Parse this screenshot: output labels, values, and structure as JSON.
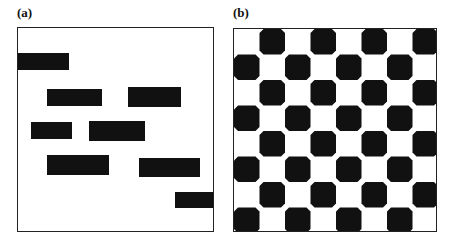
{
  "panels": [
    {
      "label": "(a)",
      "type": "random-rectangles",
      "box": {
        "x": 17,
        "y": 27,
        "w": 197,
        "h": 205
      },
      "fill_color": "#111111",
      "rectangles": [
        {
          "x": 17,
          "y": 52,
          "w": 51,
          "h": 17
        },
        {
          "x": 46,
          "y": 88,
          "w": 55,
          "h": 17
        },
        {
          "x": 127,
          "y": 86,
          "w": 53,
          "h": 20
        },
        {
          "x": 30,
          "y": 121,
          "w": 41,
          "h": 17
        },
        {
          "x": 88,
          "y": 120,
          "w": 56,
          "h": 20
        },
        {
          "x": 46,
          "y": 154,
          "w": 62,
          "h": 20
        },
        {
          "x": 138,
          "y": 157,
          "w": 61,
          "h": 19
        },
        {
          "x": 174,
          "y": 191,
          "w": 40,
          "h": 16
        }
      ]
    },
    {
      "label": "(b)",
      "type": "checkerboard",
      "box": {
        "x": 233,
        "y": 28,
        "w": 204,
        "h": 204
      },
      "rows": 8,
      "cols": 8,
      "first_cell_black": false,
      "fill_color": "#111111",
      "corner_chamfer": 4
    }
  ]
}
